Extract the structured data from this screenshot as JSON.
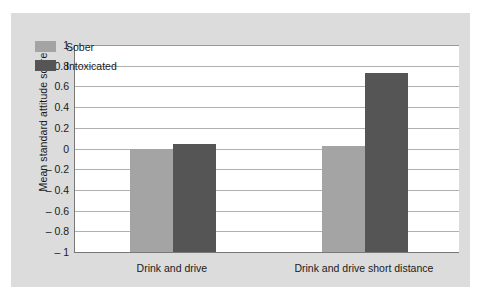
{
  "chart_data": {
    "type": "bar",
    "title": "",
    "xlabel": "",
    "ylabel": "Mean standard attitude score",
    "categories": [
      "Drink and drive",
      "Drink and drive short distance"
    ],
    "series": [
      {
        "name": "Sober",
        "color": "#a4a4a4",
        "values": [
          0.0,
          0.02
        ]
      },
      {
        "name": "Intoxicated",
        "color": "#555555",
        "values": [
          0.04,
          0.73
        ]
      }
    ],
    "ylim": [
      -1,
      1
    ],
    "yticks": [
      "1",
      "0.8",
      "0.6",
      "0.4",
      "0.2",
      "0",
      "– 0.2",
      "– 0.4",
      "– 0.6",
      "– 0.8",
      "– 1"
    ],
    "ytick_values": [
      1,
      0.8,
      0.6,
      0.4,
      0.2,
      0,
      -0.2,
      -0.4,
      -0.6,
      -0.8,
      -1
    ],
    "grid": true,
    "legend_position": "top-left",
    "legend": [
      "Sober",
      "Intoxicated"
    ],
    "bars_baseline": -1,
    "note": "Bars are drawn as columns rising from the -1 baseline; their tops mark the value."
  },
  "colors": {
    "panel_background": "#dcdcdc",
    "plot_background": "#ffffff",
    "page_background": "#ffffff",
    "gridline": "#b0b0b0",
    "axis": "#777777",
    "text": "#1a1a1a",
    "sober": "#a4a4a4",
    "intoxicated": "#555555"
  }
}
